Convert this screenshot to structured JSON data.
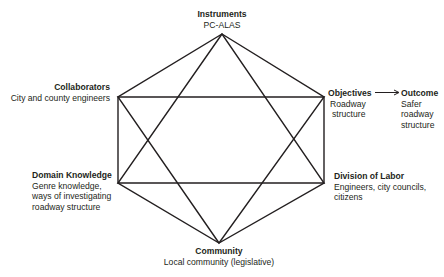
{
  "diagram": {
    "type": "activity-system-hexagram",
    "line_color": "#231f20",
    "nodes": {
      "instruments": {
        "title": "Instruments",
        "desc": [
          "PC-ALAS"
        ]
      },
      "collaborators": {
        "title": "Collaborators",
        "desc": [
          "City and county engineers"
        ]
      },
      "objectives": {
        "title": "Objectives",
        "desc": [
          "Roadway",
          "structure"
        ]
      },
      "outcome": {
        "title": "Outcome",
        "desc": [
          "Safer",
          "roadway",
          "structure"
        ]
      },
      "domain_knowledge": {
        "title": "Domain Knowledge",
        "desc": [
          "Genre knowledge,",
          "ways of investigating",
          "roadway structure"
        ]
      },
      "division_of_labor": {
        "title": "Division of Labor",
        "desc": [
          "Engineers, city councils,",
          "citizens"
        ]
      },
      "community": {
        "title": "Community",
        "desc": [
          "Local community (legislative)"
        ]
      }
    },
    "edges": [
      [
        "instruments",
        "collaborators"
      ],
      [
        "instruments",
        "objectives"
      ],
      [
        "collaborators",
        "domain_knowledge"
      ],
      [
        "objectives",
        "division_of_labor"
      ],
      [
        "domain_knowledge",
        "community"
      ],
      [
        "division_of_labor",
        "community"
      ],
      [
        "instruments",
        "domain_knowledge"
      ],
      [
        "instruments",
        "division_of_labor"
      ],
      [
        "community",
        "collaborators"
      ],
      [
        "community",
        "objectives"
      ],
      [
        "collaborators",
        "objectives"
      ],
      [
        "domain_knowledge",
        "division_of_labor"
      ],
      [
        "objectives",
        "outcome"
      ]
    ]
  }
}
